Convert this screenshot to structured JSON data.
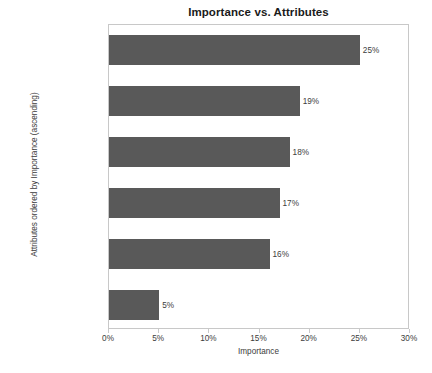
{
  "chart_data": {
    "type": "bar",
    "orientation": "horizontal",
    "title": "Importance vs. Attributes",
    "xlabel": "Importance",
    "ylabel": "Attributes ordered by Importance (ascending)",
    "categories": [
      "Video Resolution",
      "Integrated Camera",
      "Integrated GPS",
      "Flight Time",
      "Price",
      "Brand"
    ],
    "values": [
      25,
      19,
      18,
      17,
      16,
      5
    ],
    "data_labels": [
      "25%",
      "19%",
      "18%",
      "17%",
      "16%",
      "5%"
    ],
    "xlim": [
      0,
      30
    ],
    "xticks": [
      0,
      5,
      10,
      15,
      20,
      25,
      30
    ],
    "xtick_labels": [
      "0%",
      "5%",
      "10%",
      "15%",
      "20%",
      "25%",
      "30%"
    ],
    "grid": false,
    "legend": null,
    "bar_color": "#595959",
    "plot_border_color": "#c8c8c8",
    "text_color": "#3c3c3c",
    "title_color": "#1a1a1a",
    "background_color": "#ffffff"
  }
}
